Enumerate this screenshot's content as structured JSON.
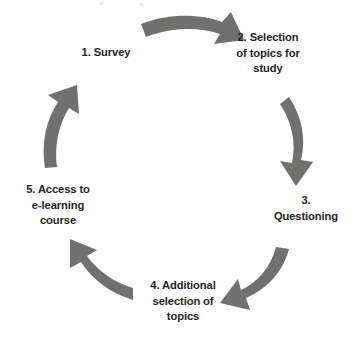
{
  "diagram": {
    "type": "cyclical-process",
    "direction": "clockwise",
    "arrow_color": "#70706f",
    "text_color": "#231f20",
    "background": "#ffffff",
    "nodes": [
      {
        "id": "survey",
        "number": "1.",
        "label": "1. Survey",
        "position": "top-left"
      },
      {
        "id": "selection-topics",
        "number": "2.",
        "label": "2. Selection\nof topics for\nstudy",
        "position": "top-right"
      },
      {
        "id": "questioning",
        "number": "3.",
        "label": "3.\nQuestioning",
        "position": "right"
      },
      {
        "id": "additional-topics",
        "number": "4.",
        "label": "4. Additional\nselection of\ntopics",
        "position": "bottom"
      },
      {
        "id": "elearning-access",
        "number": "5.",
        "label": "5. Access to\ne-learning\ncourse",
        "position": "left"
      }
    ],
    "arrows": [
      {
        "id": "arrow-1-to-2",
        "from": "survey",
        "to": "selection-topics",
        "direction": "right-down"
      },
      {
        "id": "arrow-2-to-3",
        "from": "selection-topics",
        "to": "questioning",
        "direction": "down"
      },
      {
        "id": "arrow-3-to-4",
        "from": "questioning",
        "to": "additional-topics",
        "direction": "down-left"
      },
      {
        "id": "arrow-4-to-5",
        "from": "additional-topics",
        "to": "elearning-access",
        "direction": "left-up"
      },
      {
        "id": "arrow-5-to-1",
        "from": "elearning-access",
        "to": "survey",
        "direction": "up"
      }
    ]
  }
}
